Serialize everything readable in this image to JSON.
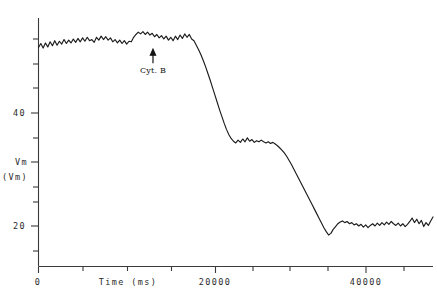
{
  "chart_data": {
    "type": "line",
    "title": "",
    "xlabel": "Time (ms)",
    "ylabel": "Vm",
    "ylabel_units": "(Vm)",
    "xlim": [
      0,
      51000
    ],
    "ylim": [
      8,
      61
    ],
    "grid": false,
    "legend": null,
    "xticks": [
      0,
      5000,
      10000,
      15000,
      20000,
      25000,
      30000,
      35000,
      40000,
      45000,
      50000
    ],
    "xticklabels": [
      "0",
      "",
      "",
      "",
      "20000",
      "",
      "",
      "",
      "40000",
      "",
      ""
    ],
    "yticks": [
      15,
      20,
      25,
      30,
      35,
      40,
      45,
      50,
      55
    ],
    "yticklabels": [
      "",
      "20",
      "",
      "",
      "Vm",
      "40",
      "",
      "",
      ""
    ],
    "annotations": [
      {
        "label": "Cyt. B",
        "x": 14800,
        "y": 52,
        "marker": "up-arrow"
      }
    ],
    "series": [
      {
        "name": "Vm",
        "x": [
          0,
          300,
          600,
          900,
          1200,
          1500,
          1800,
          2100,
          2400,
          2700,
          3000,
          3300,
          3600,
          3900,
          4200,
          4500,
          4800,
          5100,
          5400,
          5700,
          6000,
          6300,
          6600,
          6900,
          7200,
          7500,
          7800,
          8100,
          8400,
          8700,
          9000,
          9300,
          9600,
          9900,
          10200,
          10500,
          10800,
          11100,
          11400,
          11700,
          12000,
          12300,
          12600,
          12900,
          13200,
          13500,
          13800,
          14100,
          14400,
          14700,
          15000,
          15300,
          15600,
          15900,
          16200,
          16500,
          16800,
          17100,
          17400,
          17700,
          18000,
          18300,
          18600,
          18900,
          19200,
          19500,
          19800,
          20100,
          20400,
          20700,
          21000,
          21300,
          21600,
          21900,
          22200,
          22500,
          22800,
          23100,
          23400,
          23700,
          24000,
          24300,
          24600,
          24900,
          25200,
          25500,
          25800,
          26100,
          26400,
          26700,
          27000,
          27300,
          27600,
          27900,
          28200,
          28500,
          28800,
          29100,
          29400,
          29700,
          30000,
          30300,
          30600,
          30900,
          31200,
          31500,
          31800,
          32100,
          32400,
          32700,
          33000,
          33300,
          33600,
          33900,
          34200,
          34500,
          34800,
          35100,
          35400,
          35700,
          36000,
          36300,
          36600,
          36900,
          37200,
          37500,
          37800,
          38100,
          38400,
          38700,
          39000,
          39300,
          39600,
          39900,
          40200,
          40500,
          40800,
          41100,
          41400,
          41700,
          42000,
          42300,
          42600,
          42900,
          43200,
          43500,
          43800,
          44100,
          44400,
          44700,
          45000,
          45300,
          45600,
          45900,
          46200,
          46500,
          46800,
          47100,
          47400,
          47700,
          48000,
          48300,
          48600,
          48900,
          49200,
          49500,
          49800,
          50100,
          50400,
          50700,
          51000
        ],
        "y": [
          51.6,
          52.3,
          51.5,
          52.4,
          51.7,
          52.6,
          51.9,
          52.8,
          52.0,
          52.7,
          52.2,
          53.0,
          52.3,
          52.9,
          52.4,
          53.1,
          52.5,
          53.2,
          52.6,
          53.3,
          52.7,
          53.4,
          52.8,
          53.0,
          52.5,
          53.4,
          52.9,
          53.6,
          53.0,
          53.5,
          52.9,
          53.3,
          52.6,
          53.0,
          52.4,
          52.9,
          52.3,
          52.8,
          52.2,
          52.7,
          52.6,
          53.4,
          53.9,
          54.3,
          54.0,
          54.4,
          53.9,
          54.3,
          53.8,
          54.1,
          53.5,
          53.9,
          53.3,
          53.7,
          53.1,
          53.6,
          52.9,
          53.4,
          52.8,
          53.6,
          53.0,
          53.8,
          53.2,
          54.0,
          53.4,
          53.9,
          53.1,
          52.8,
          52.0,
          51.2,
          50.3,
          49.3,
          48.2,
          47.0,
          45.8,
          44.5,
          43.2,
          41.9,
          40.6,
          39.4,
          38.2,
          37.1,
          36.2,
          35.5,
          35.0,
          34.7,
          35.2,
          34.8,
          35.4,
          34.9,
          35.6,
          35.0,
          35.3,
          34.8,
          35.1,
          34.9,
          35.2,
          34.9,
          34.7,
          34.9,
          34.6,
          34.8,
          34.5,
          34.2,
          33.8,
          33.4,
          32.9,
          32.3,
          31.6,
          30.9,
          30.1,
          29.3,
          28.5,
          27.7,
          26.9,
          26.1,
          25.3,
          24.5,
          23.7,
          22.9,
          22.1,
          21.3,
          20.5,
          19.7,
          19.0,
          18.4,
          18.7,
          19.4,
          19.9,
          20.4,
          20.7,
          20.9,
          20.6,
          20.8,
          20.4,
          20.6,
          20.2,
          20.4,
          20.0,
          20.3,
          19.8,
          20.2,
          19.7,
          20.1,
          20.4,
          20.0,
          20.5,
          20.1,
          20.6,
          20.2,
          20.7,
          20.3,
          20.8,
          20.4,
          20.1,
          20.5,
          20.0,
          20.4,
          19.9,
          20.3,
          20.8,
          21.4,
          20.6,
          21.2,
          20.4,
          21.0,
          19.9,
          20.6,
          20.1,
          20.9,
          21.6
        ]
      }
    ]
  },
  "figure": {
    "background_color": "#ffffff",
    "trace_color": "#1c1c1c",
    "axis_color": "#3a3a3a"
  }
}
